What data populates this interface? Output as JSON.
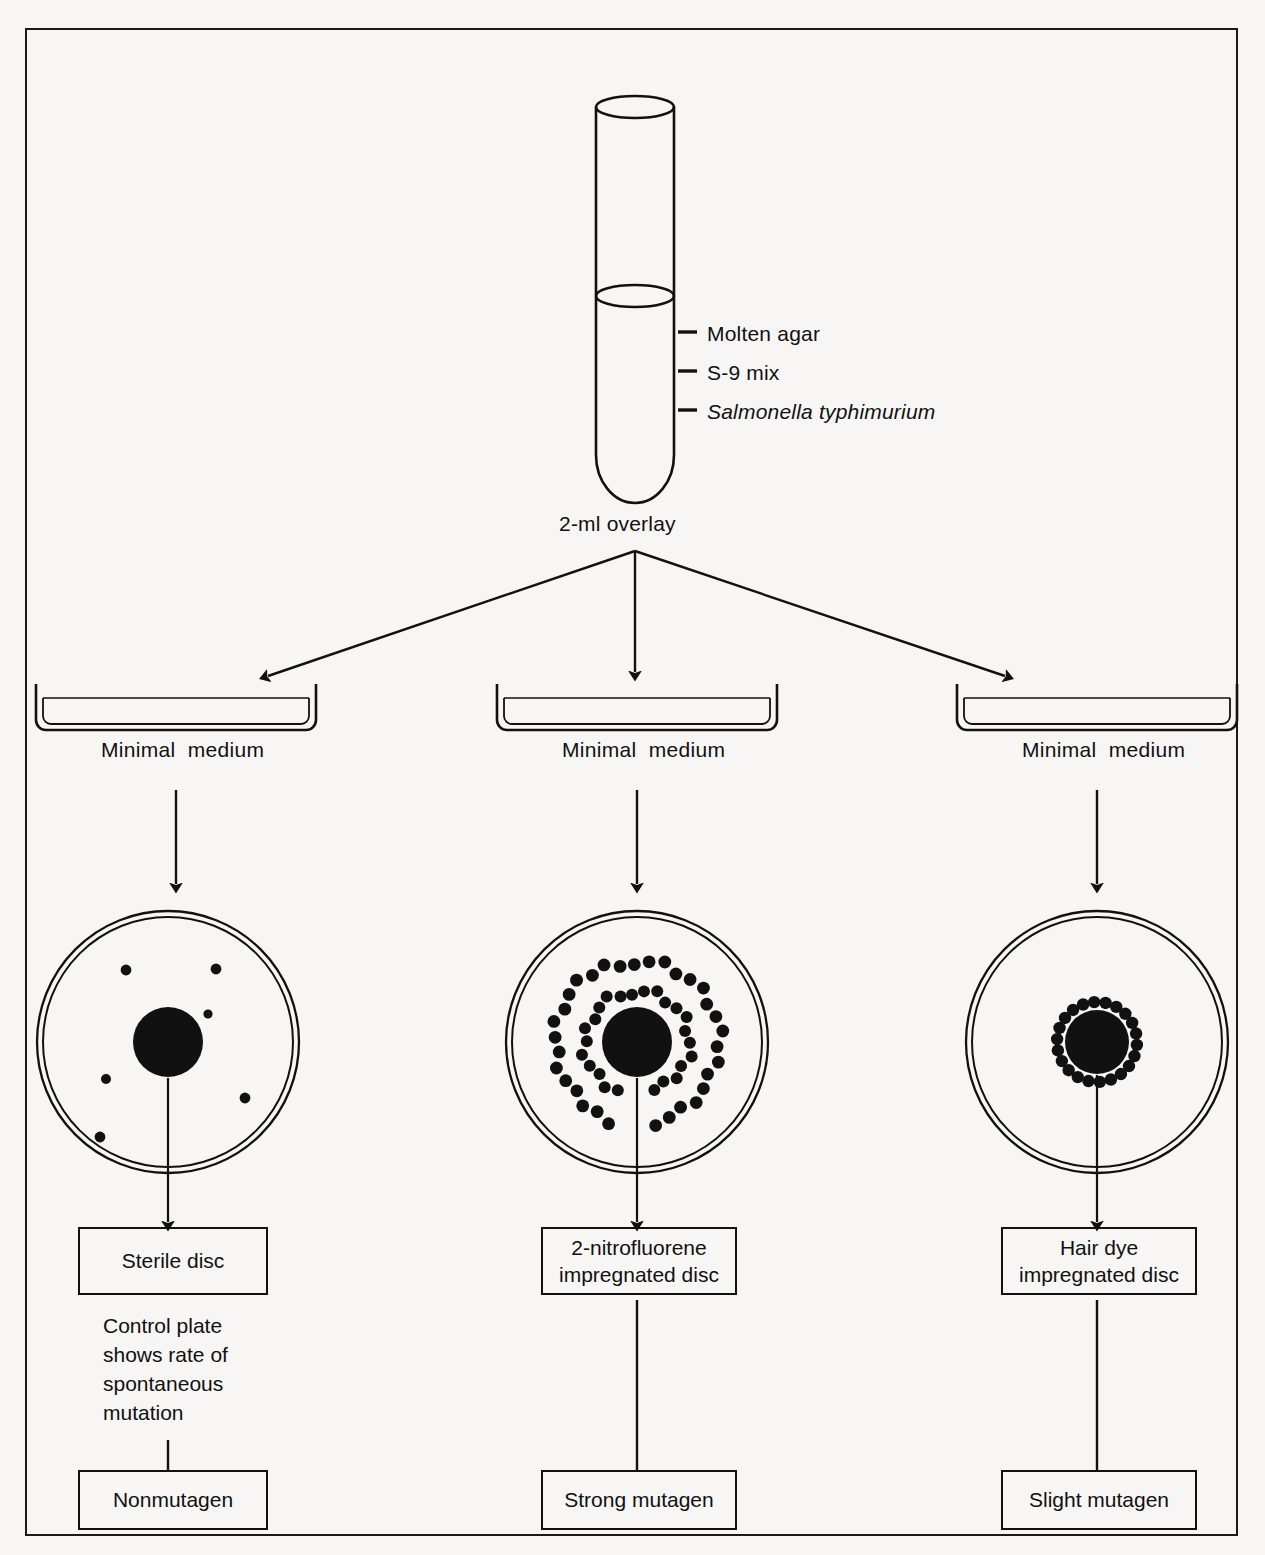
{
  "figure": {
    "title_region": "Ames test procedure diagram",
    "credit_text": "ing Co., Inc."
  },
  "tube": {
    "overlay_label": "2-ml overlay",
    "contents": [
      {
        "dash": "—",
        "label": "Molten agar",
        "italic": false
      },
      {
        "dash": "—",
        "label": "S-9 mix",
        "italic": false
      },
      {
        "dash": "—",
        "label": "Salmonella typhimurium",
        "italic": true
      }
    ]
  },
  "branches": [
    {
      "id": "left",
      "medium_label": "Minimal  medium",
      "disc_box": "Sterile disc",
      "caption": "Control plate\nshows rate of\nspontaneous\nmutation",
      "result_box": "Nonmutagen",
      "colony_pattern": "scattered",
      "colony_count": 7
    },
    {
      "id": "middle",
      "medium_label": "Minimal  medium",
      "disc_box": "2-nitrofluorene\nimpregnated disc",
      "caption": "",
      "result_box": "Strong mutagen",
      "colony_pattern": "double-ring",
      "colony_count": 62
    },
    {
      "id": "right",
      "medium_label": "Minimal  medium",
      "disc_box": "Hair dye\nimpregnated disc",
      "caption": "",
      "result_box": "Slight mutagen",
      "colony_pattern": "single-ring",
      "colony_count": 22
    }
  ],
  "colors": {
    "ink": "#111111",
    "paper": "#f7f6f4"
  }
}
